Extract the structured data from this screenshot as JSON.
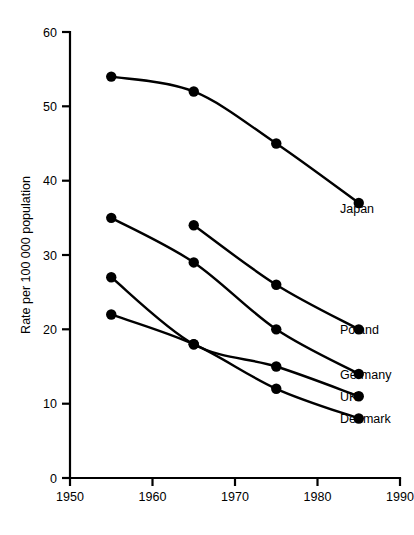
{
  "chart_data": {
    "type": "line",
    "title": "",
    "subtitle": "",
    "xlabel": "",
    "ylabel": "Rate per 100 000 population",
    "xlim": [
      1950,
      1990
    ],
    "ylim": [
      0,
      60
    ],
    "grid": false,
    "legend_position": "right-inline-labels",
    "x_ticks": [
      1950,
      1960,
      1970,
      1980,
      1990
    ],
    "x_tick_labels": [
      "1950",
      "1960",
      "1970",
      "1980",
      "1990"
    ],
    "y_ticks": [
      0,
      10,
      20,
      30,
      40,
      50,
      60
    ],
    "y_tick_labels": [
      "0",
      "10",
      "20",
      "30",
      "40",
      "50",
      "60"
    ],
    "marker": "filled-circle",
    "series": [
      {
        "name": "Japan",
        "label": "Japan",
        "color": "#000000",
        "x": [
          1955,
          1965,
          1975,
          1985
        ],
        "values": [
          54,
          52,
          45,
          37
        ]
      },
      {
        "name": "Poland",
        "label": "Poland",
        "color": "#000000",
        "x": [
          1965,
          1975,
          1985
        ],
        "values": [
          34,
          26,
          20
        ]
      },
      {
        "name": "Germany",
        "label": "Germany",
        "color": "#000000",
        "x": [
          1955,
          1965,
          1975,
          1985
        ],
        "values": [
          35,
          29,
          20,
          14
        ]
      },
      {
        "name": "UK",
        "label": "UK",
        "color": "#000000",
        "x": [
          1955,
          1965,
          1975,
          1985
        ],
        "values": [
          27,
          18,
          15,
          11
        ]
      },
      {
        "name": "Denmark",
        "label": "Denmark",
        "color": "#000000",
        "x": [
          1955,
          1965,
          1975,
          1985
        ],
        "values": [
          22,
          18,
          12,
          8
        ]
      }
    ]
  },
  "axes": {
    "y_axis_title": "Rate per 100 000 population"
  },
  "ticks": {
    "y": {
      "t0": "0",
      "t10": "10",
      "t20": "20",
      "t30": "30",
      "t40": "40",
      "t50": "50",
      "t60": "60"
    },
    "x": {
      "t1950": "1950",
      "t1960": "1960",
      "t1970": "1970",
      "t1980": "1980",
      "t1990": "1990"
    }
  },
  "series_labels": {
    "japan": "Japan",
    "poland": "Poland",
    "germany": "Germany",
    "uk": "UK",
    "denmark": "Denmark"
  }
}
